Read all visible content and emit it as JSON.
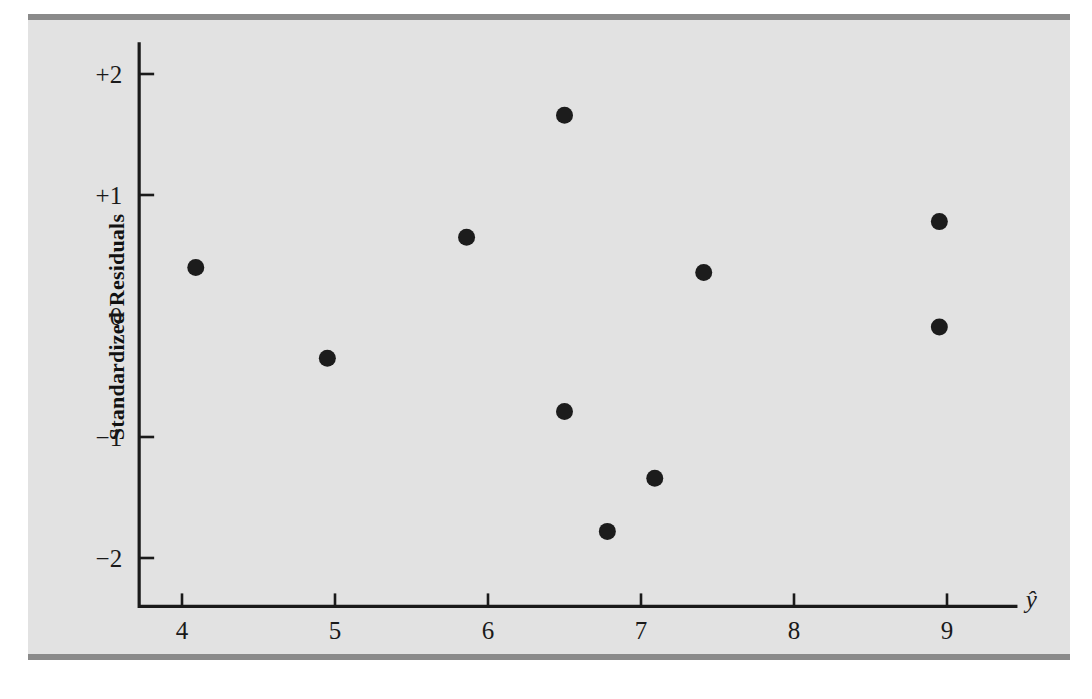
{
  "figure": {
    "background_color": "#e2e2e2",
    "rule_color": "#8a8a8a",
    "point_color": "#1c1c1c",
    "axis_color": "#1a1a1a"
  },
  "chart_data": {
    "type": "scatter",
    "title": "",
    "xlabel": "ŷ",
    "ylabel": "Standardized Residuals",
    "xlim": [
      3.72,
      9.45
    ],
    "ylim": [
      -2.4,
      2.25
    ],
    "grid": false,
    "legend": null,
    "xticks": [
      4,
      5,
      6,
      7,
      8,
      9
    ],
    "xtick_labels": [
      "4",
      "5",
      "6",
      "7",
      "8",
      "9"
    ],
    "yticks": [
      2,
      1,
      0,
      -1,
      -2
    ],
    "ytick_labels": [
      "+2",
      "+1",
      "0",
      "−1",
      "−2"
    ],
    "ytick_marks_drawn": [
      2,
      1,
      -1,
      -2
    ],
    "points": [
      {
        "x": 4.09,
        "y": 0.4
      },
      {
        "x": 4.95,
        "y": -0.35
      },
      {
        "x": 5.86,
        "y": 0.65
      },
      {
        "x": 6.5,
        "y": 1.66
      },
      {
        "x": 6.5,
        "y": -0.79
      },
      {
        "x": 6.78,
        "y": -1.78
      },
      {
        "x": 7.09,
        "y": -1.34
      },
      {
        "x": 7.41,
        "y": 0.36
      },
      {
        "x": 8.95,
        "y": 0.78
      },
      {
        "x": 8.95,
        "y": -0.09
      }
    ]
  }
}
